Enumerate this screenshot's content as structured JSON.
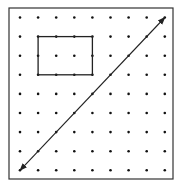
{
  "diagram": {
    "type": "geoboard-dot-grid",
    "grid": {
      "columns": 9,
      "rows": 9,
      "origin_x": 20,
      "origin_y": 17.5,
      "spacing_x": 18.1,
      "spacing_y": 19.1
    },
    "frame": {
      "x": 9,
      "y": 8,
      "width": 164,
      "height": 171
    },
    "rectangle": {
      "col_start": 2,
      "col_end": 5,
      "row_start": 2,
      "row_end": 4
    },
    "arrow": {
      "from": {
        "col": 1,
        "row": 9
      },
      "to": {
        "col": 9,
        "row": 1
      },
      "double_headed": true
    },
    "colors": {
      "stroke": "#222222",
      "dot": "#111111",
      "background": "#ffffff"
    }
  }
}
